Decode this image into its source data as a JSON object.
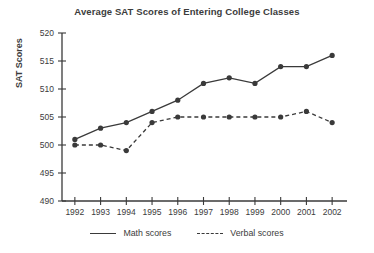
{
  "chart_data": {
    "type": "line",
    "title": "Average SAT Scores of Entering College Classes",
    "xlabel": "",
    "ylabel": "SAT Scores",
    "categories": [
      "1992",
      "1993",
      "1994",
      "1995",
      "1996",
      "1997",
      "1998",
      "1999",
      "2000",
      "2001",
      "2002"
    ],
    "x": [
      1992,
      1993,
      1994,
      1995,
      1996,
      1997,
      1998,
      1999,
      2000,
      2001,
      2002
    ],
    "series": [
      {
        "name": "Math scores",
        "style": "solid",
        "values": [
          501,
          503,
          504,
          506,
          508,
          511,
          512,
          511,
          514,
          514,
          516
        ]
      },
      {
        "name": "Verbal scores",
        "style": "dashed",
        "values": [
          500,
          500,
          499,
          504,
          505,
          505,
          505,
          505,
          505,
          506,
          504
        ]
      }
    ],
    "ylim": [
      490,
      520
    ],
    "yticks": [
      490,
      495,
      500,
      505,
      510,
      515,
      520
    ],
    "ytick_labels": [
      "490",
      "495",
      "500",
      "505",
      "510",
      "515",
      "520"
    ],
    "grid": false,
    "legend_position": "bottom",
    "marker": "filled-circle",
    "line_color": "#3a3a3a"
  },
  "legend": {
    "entries": [
      {
        "label": "Math scores",
        "swatch": "solid-line-swatch"
      },
      {
        "label": "Verbal scores",
        "swatch": "dashed-line-swatch"
      }
    ]
  }
}
